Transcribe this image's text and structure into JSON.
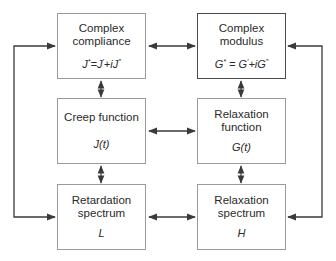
{
  "diagram": {
    "type": "block-diagram",
    "boxes": {
      "complex_compliance": {
        "title": "Complex\ncompliance",
        "formula": {
          "lhs": "J",
          "lhs_sup": "*",
          "eq": "=",
          "t1": "J",
          "t1_sup": "′",
          "plus": "+i",
          "t2": "J",
          "t2_sup": "″"
        }
      },
      "complex_modulus": {
        "title": "Complex\nmodulus",
        "formula": {
          "lhs": "G",
          "lhs_sup": "*",
          "eq": " = ",
          "t1": "G",
          "t1_sup": "′",
          "plus": "+i",
          "t2": "G",
          "t2_sup": "″"
        }
      },
      "creep_function": {
        "title": "Creep function",
        "symbol": "J(t)"
      },
      "relaxation_function": {
        "title": "Relaxation\nfunction",
        "symbol": "G(t)"
      },
      "retardation_spectrum": {
        "title": "Retardation\nspectrum",
        "symbol": "L"
      },
      "relaxation_spectrum": {
        "title": "Relaxation\nspectrum",
        "symbol": "H"
      }
    },
    "connections": [
      {
        "from": "complex_compliance",
        "to": "complex_modulus",
        "direction": "both"
      },
      {
        "from": "creep_function",
        "to": "relaxation_function",
        "direction": "both"
      },
      {
        "from": "retardation_spectrum",
        "to": "relaxation_spectrum",
        "direction": "both"
      },
      {
        "from": "complex_compliance",
        "to": "creep_function",
        "direction": "both"
      },
      {
        "from": "creep_function",
        "to": "retardation_spectrum",
        "direction": "both"
      },
      {
        "from": "complex_modulus",
        "to": "relaxation_function",
        "direction": "both"
      },
      {
        "from": "relaxation_function",
        "to": "relaxation_spectrum",
        "direction": "both"
      },
      {
        "from": "complex_compliance",
        "to": "retardation_spectrum",
        "direction": "both",
        "route": "outer-left"
      },
      {
        "from": "complex_modulus",
        "to": "relaxation_spectrum",
        "direction": "both",
        "route": "outer-right"
      }
    ],
    "colors": {
      "line": "#3a3a3a",
      "box_border": "#9a9a9a",
      "box_border_emphasis": "#4a4a4a",
      "text": "#2a2a2a"
    }
  }
}
